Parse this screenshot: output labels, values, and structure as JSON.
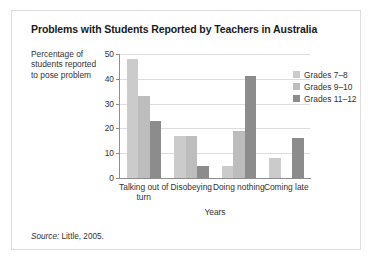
{
  "source_note": {
    "label": "Source:",
    "text": "Little, 2005."
  },
  "legend": {
    "position": "right",
    "entries": [
      {
        "label": "Grades 7–8",
        "color": "#cbcbcb"
      },
      {
        "label": "Grades 9–10",
        "color": "#bdbdbd"
      },
      {
        "label": "Grades 11–12",
        "color": "#8c8c8c"
      }
    ]
  },
  "chart_data": {
    "type": "bar",
    "title": "Problems with Students Reported by Teachers in Australia",
    "xlabel": "Years",
    "ylabel": "Percentage of students reported to pose problem",
    "categories": [
      "Talking out of turn",
      "Disobeying",
      "Doing nothing",
      "Coming late"
    ],
    "series": [
      {
        "name": "Grades 7–8",
        "color": "#cbcbcb",
        "values": [
          48,
          17,
          5,
          8
        ]
      },
      {
        "name": "Grades 9–10",
        "color": "#bdbdbd",
        "values": [
          33,
          17,
          19,
          0
        ]
      },
      {
        "name": "Grades 11–12",
        "color": "#8c8c8c",
        "values": [
          23,
          5,
          41,
          16
        ]
      }
    ],
    "ylim": [
      0,
      50
    ],
    "yticks": [
      0,
      10,
      20,
      30,
      40,
      50
    ],
    "grid": true
  }
}
